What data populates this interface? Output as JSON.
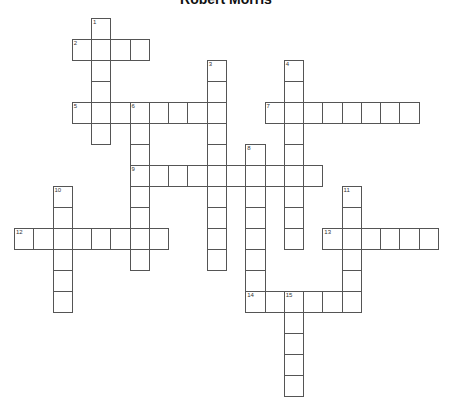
{
  "title": "Robert Morris",
  "grid": {
    "origin_x": 14,
    "origin_y": 18,
    "col_width": 19.27,
    "row_height": 21,
    "line_color": "#555555",
    "cell_color": "#ffffff"
  },
  "words": [
    {
      "number": "1",
      "direction": "down",
      "row": 0,
      "col": 4,
      "length": 6
    },
    {
      "number": "2",
      "direction": "across",
      "row": 1,
      "col": 3,
      "length": 4
    },
    {
      "number": "3",
      "direction": "down",
      "row": 2,
      "col": 10,
      "length": 10
    },
    {
      "number": "4",
      "direction": "down",
      "row": 2,
      "col": 14,
      "length": 9
    },
    {
      "number": "5",
      "direction": "across",
      "row": 4,
      "col": 3,
      "length": 8
    },
    {
      "number": "6",
      "direction": "down",
      "row": 4,
      "col": 6,
      "length": 8
    },
    {
      "number": "7",
      "direction": "across",
      "row": 4,
      "col": 13,
      "length": 8
    },
    {
      "number": "8",
      "direction": "down",
      "row": 6,
      "col": 12,
      "length": 8
    },
    {
      "number": "9",
      "direction": "across",
      "row": 7,
      "col": 6,
      "length": 10
    },
    {
      "number": "10",
      "direction": "down",
      "row": 8,
      "col": 2,
      "length": 6
    },
    {
      "number": "11",
      "direction": "down",
      "row": 8,
      "col": 17,
      "length": 6
    },
    {
      "number": "12",
      "direction": "across",
      "row": 10,
      "col": 0,
      "length": 8
    },
    {
      "number": "13",
      "direction": "across",
      "row": 10,
      "col": 16,
      "length": 6
    },
    {
      "number": "14",
      "direction": "across",
      "row": 13,
      "col": 12,
      "length": 6
    },
    {
      "number": "15",
      "direction": "down",
      "row": 13,
      "col": 14,
      "length": 5
    }
  ]
}
